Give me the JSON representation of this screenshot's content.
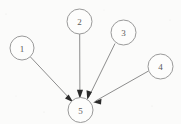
{
  "diagram": {
    "type": "directed-graph",
    "background_color": "#fbfbfa",
    "node_fill": "#fdfdfc",
    "node_stroke": "#9a9a9a",
    "edge_color": "#8d8d8d",
    "arrow_color": "#2b2b2b",
    "node_radius": 12.5,
    "nodes": [
      {
        "id": "1",
        "label": "1",
        "cx": 22,
        "cy": 48,
        "r": 12
      },
      {
        "id": "2",
        "label": "2",
        "cx": 79.5,
        "cy": 21.5,
        "r": 12.5
      },
      {
        "id": "3",
        "label": "3",
        "cx": 123.5,
        "cy": 32.5,
        "r": 12.5
      },
      {
        "id": "4",
        "label": "4",
        "cx": 160.5,
        "cy": 66.5,
        "r": 12.5
      },
      {
        "id": "5",
        "label": "5",
        "cx": 80.5,
        "cy": 110,
        "r": 12.5
      }
    ],
    "edges": [
      {
        "from": "1",
        "to": "5",
        "x1": 30.5,
        "y1": 57.0,
        "x2": 71.5,
        "y2": 100.5
      },
      {
        "from": "2",
        "to": "5",
        "x1": 79.7,
        "y1": 34.0,
        "x2": 79.9,
        "y2": 96.5
      },
      {
        "from": "3",
        "to": "5",
        "x1": 115.0,
        "y1": 43.5,
        "x2": 88.5,
        "y2": 97.5
      },
      {
        "from": "4",
        "to": "5",
        "x1": 148.5,
        "y1": 71.0,
        "x2": 93.0,
        "y2": 102.0
      }
    ],
    "edge_count": 4,
    "node_count": 5,
    "sink_node": "5"
  }
}
